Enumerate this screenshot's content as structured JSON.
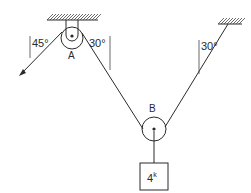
{
  "diagram": {
    "type": "pulley-system",
    "pulleys": [
      {
        "id": "A",
        "label": "A"
      },
      {
        "id": "B",
        "label": "B"
      }
    ],
    "angles": {
      "force_angle": "45°",
      "rope_angle_at_A": "30°",
      "rope_angle_at_anchor": "30°"
    },
    "load": {
      "label": "4",
      "unit": "k"
    },
    "colors": {
      "ink": "#2a2a2a",
      "background": "#ffffff"
    }
  }
}
